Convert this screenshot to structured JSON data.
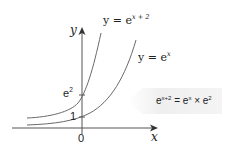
{
  "diagram": {
    "axes": {
      "x_label": "x",
      "y_label": "y",
      "origin_label": "0"
    },
    "curves": [
      {
        "name": "shifted",
        "label_prefix": "y = e",
        "label_exponent": "x + 2",
        "y_intercept_label_base": "e",
        "y_intercept_label_exp": "2"
      },
      {
        "name": "base",
        "label_prefix": "y = e",
        "label_exponent": "x",
        "y_intercept_label": "1"
      }
    ],
    "callout": {
      "lhs_base": "e",
      "lhs_exp": "x+2",
      "eq": " = ",
      "mid_base": "e",
      "mid_exp": "x",
      "times": " × ",
      "rhs_base": "e",
      "rhs_exp": "2"
    },
    "colors": {
      "axis": "#555555",
      "curve": "#6a6a6a",
      "callout_fill": "#eeeeee"
    }
  }
}
